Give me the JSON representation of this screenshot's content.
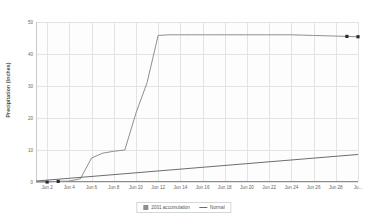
{
  "chart_data": {
    "type": "line",
    "title": "",
    "xlabel": "",
    "ylabel": "Precipitation (Inches)",
    "ylim": [
      0,
      50
    ],
    "yticks": [
      0,
      10,
      20,
      30,
      40,
      50
    ],
    "ytick_labels": [
      "0",
      "10",
      "20",
      "30",
      "40",
      "50"
    ],
    "xlim": [
      "Jun 1",
      "Jun 30"
    ],
    "xtick_labels": [
      "Jun 2",
      "Jun 4",
      "Jun 6",
      "Jun 8",
      "Jun 10",
      "Jun 12",
      "Jun 14",
      "Jun 16",
      "Jun 18",
      "Jun 20",
      "Jun 22",
      "Jun 24",
      "Jun 26",
      "Jun 28",
      "Ju..."
    ],
    "grid": true,
    "legend_position": "bottom-center",
    "series": [
      {
        "name": "2001 accumulation",
        "color": "#8f8f8f",
        "marker_color": "#2b2b2b",
        "x": [
          1,
          2,
          3,
          4,
          5,
          6,
          7,
          8,
          9,
          10,
          11,
          12,
          13,
          14,
          15,
          16,
          17,
          18,
          19,
          20,
          21,
          22,
          23,
          24,
          25,
          26,
          27,
          28,
          29,
          30
        ],
        "values": [
          0,
          0,
          0.2,
          0.3,
          1.0,
          7.5,
          9.0,
          9.6,
          10.0,
          21.5,
          31.0,
          45.8,
          46.0,
          46.0,
          46.0,
          46.0,
          46.0,
          46.0,
          46.0,
          46.0,
          46.0,
          46.0,
          46.0,
          46.0,
          45.9,
          45.8,
          45.7,
          45.6,
          45.5,
          45.4
        ],
        "markers_at": [
          [
            2,
            0
          ],
          [
            3,
            0.2
          ],
          [
            29,
            45.5
          ],
          [
            30,
            45.4
          ]
        ]
      },
      {
        "name": "Normal",
        "color": "#6d6d6d",
        "x": [
          1,
          30
        ],
        "values": [
          0.3,
          8.6
        ]
      }
    ]
  },
  "legend": {
    "entries": [
      {
        "label": "2001 accumulation",
        "swatch": "box-swatch-icon"
      },
      {
        "label": "Normal",
        "swatch": "line-swatch-icon"
      }
    ]
  }
}
